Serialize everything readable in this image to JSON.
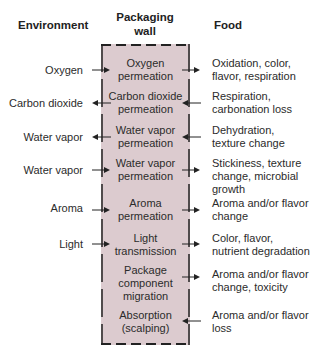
{
  "headers": {
    "environment": "Environment",
    "wall": "Packaging\nwall",
    "food": "Food"
  },
  "colors": {
    "wall_fill": "#dccbcf",
    "line": "#222222"
  },
  "rows": [
    {
      "env": "Oxygen",
      "process": "Oxygen\npermeation",
      "food": "Oxidation, color,\nflavor, respiration",
      "left_dir": "in",
      "right_dir": "out"
    },
    {
      "env": "Carbon dioxide",
      "process": "Carbon dioxide\npermeation",
      "food": "Respiration,\ncarbonation loss",
      "left_dir": "out",
      "right_dir": "in"
    },
    {
      "env": "Water vapor",
      "process": "Water vapor\npermeation",
      "food": "Dehydration,\ntexture change",
      "left_dir": "out",
      "right_dir": "in"
    },
    {
      "env": "Water vapor",
      "process": "Water vapor\npermeation",
      "food": "Stickiness, texture\nchange, microbial\ngrowth",
      "left_dir": "in",
      "right_dir": "out"
    },
    {
      "env": "Aroma",
      "process": "Aroma\npermeation",
      "food": "Aroma and/or flavor\nchange",
      "left_dir": "in",
      "right_dir": "out"
    },
    {
      "env": "Light",
      "process": "Light\ntransmission",
      "food": "Color, flavor,\nnutrient degradation",
      "left_dir": "in",
      "right_dir": "out"
    },
    {
      "env": "",
      "process": "Package\ncomponent\nmigration",
      "food": "Aroma and/or flavor\nchange, toxicity",
      "left_dir": "none",
      "right_dir": "out"
    },
    {
      "env": "",
      "process": "Absorption\n(scalping)",
      "food": "Aroma and/or flavor\nloss",
      "left_dir": "none",
      "right_dir": "in"
    }
  ]
}
